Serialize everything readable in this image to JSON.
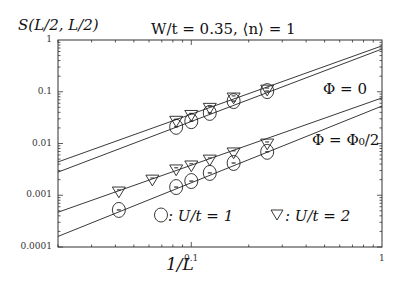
{
  "chart_data": {
    "type": "scatter",
    "title": "W/t = 0.35, ⟨n⟩ = 1",
    "ylabel": "S(L/2, L/2)",
    "xlabel": "1/L",
    "xscale": "log",
    "yscale": "log",
    "xlim": [
      0.02,
      1
    ],
    "ylim": [
      0.0001,
      1
    ],
    "x_ticks": [
      "0.1",
      "1"
    ],
    "y_ticks": [
      "1",
      "0.1",
      "0.01",
      "0.001",
      "0.0001"
    ],
    "grid": false,
    "annotations": [
      "Φ = 0",
      "Φ = Φ0/2"
    ],
    "legend": [
      "○: U/t = 1",
      "▽: U/t = 2"
    ],
    "series": [
      {
        "name": "U/t=1, Φ=0",
        "marker": "circle",
        "x": [
          0.0833,
          0.1,
          0.125,
          0.1667,
          0.25
        ],
        "y": [
          0.021,
          0.027,
          0.039,
          0.066,
          0.103
        ]
      },
      {
        "name": "U/t=2, Φ=0",
        "marker": "triangle-down",
        "x": [
          0.0833,
          0.1,
          0.125,
          0.1667,
          0.25
        ],
        "y": [
          0.027,
          0.035,
          0.048,
          0.076,
          0.108
        ]
      },
      {
        "name": "U/t=1, Φ=Φ0/2",
        "marker": "circle",
        "x": [
          0.0417,
          0.0833,
          0.1,
          0.125,
          0.1667,
          0.25
        ],
        "y": [
          0.00052,
          0.00144,
          0.00188,
          0.0027,
          0.0042,
          0.0069
        ]
      },
      {
        "name": "U/t=2, Φ=Φ0/2",
        "marker": "triangle-down",
        "x": [
          0.0417,
          0.0625,
          0.0833,
          0.1,
          0.125,
          0.1667,
          0.25
        ],
        "y": [
          0.00116,
          0.00197,
          0.0031,
          0.0037,
          0.0048,
          0.0066,
          0.0098
        ]
      }
    ],
    "fit_lines": [
      {
        "name": "fit U/t=2, Φ=0",
        "x": [
          0.02,
          1
        ],
        "y": [
          0.0044,
          0.77
        ]
      },
      {
        "name": "fit U/t=1, Φ=0",
        "x": [
          0.02,
          1
        ],
        "y": [
          0.0028,
          0.67
        ]
      },
      {
        "name": "fit U/t=2, Φ=Φ0/2",
        "x": [
          0.02,
          1
        ],
        "y": [
          0.00047,
          0.076
        ]
      },
      {
        "name": "fit U/t=1, Φ=Φ0/2",
        "x": [
          0.02,
          1
        ],
        "y": [
          0.00016,
          0.053
        ]
      }
    ]
  },
  "labels": {
    "ylabel": "S(L/2, L/2)",
    "title": "W/t = 0.35,  ⟨n⟩ = 1",
    "xlabel": "1/L",
    "phi0": "Φ = 0",
    "phihalf": "Φ = Φ₀/2",
    "legend_circle": ": U/t = 1",
    "legend_triangle": ": U/t = 2",
    "yt1": "1",
    "yt2": "0.1",
    "yt3": "0.01",
    "yt4": "0.001",
    "yt5": "0.0001",
    "xt1": "0.1",
    "xt2": "1"
  }
}
